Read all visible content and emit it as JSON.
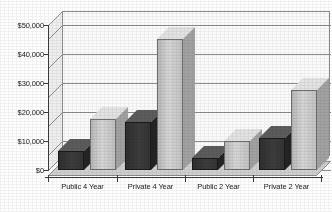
{
  "chart_data": {
    "type": "bar",
    "title": "",
    "subtitle": "",
    "xlabel": "",
    "ylabel": "",
    "categories": [
      "Public 4 Year",
      "Private 4 Year",
      "Public 2 Year",
      "Private 2 Year"
    ],
    "series": [
      {
        "name": "Series 1",
        "color": "#3a3a3a",
        "values": [
          6500,
          16500,
          4000,
          11000
        ]
      },
      {
        "name": "Series 2",
        "color": "#c9c9c9",
        "values": [
          17500,
          45000,
          10000,
          27500
        ]
      }
    ],
    "ylim": [
      0,
      50000
    ],
    "ytick_values": [
      0,
      10000,
      20000,
      30000,
      40000,
      50000
    ],
    "ytick_labels": [
      "$0",
      "$10,000",
      "$20,000",
      "$30,000",
      "$40,000",
      "$50,000"
    ],
    "grid": true,
    "grid_axis": "y",
    "legend": false,
    "legend_position": "none",
    "projection": "3d",
    "annotations": []
  },
  "axis": {
    "y_labels": [
      "$50,000",
      "$40,000",
      "$30,000",
      "$20,000",
      "$10,000",
      "$0"
    ],
    "x_labels": [
      "Public 4 Year",
      "Private 4 Year",
      "Public 2 Year",
      "Private 2 Year"
    ]
  },
  "colors": {
    "series_dark": "#3a3a3a",
    "series_light": "#c9c9c9",
    "grid_line": "#8d8d8d",
    "plot_background": "#fbfbfb",
    "page_background": "#ffffff",
    "text": "#1a1a1a"
  }
}
